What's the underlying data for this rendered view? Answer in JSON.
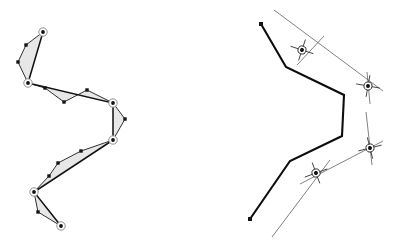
{
  "figure": {
    "background_color": "#ffffff",
    "width": 396,
    "height": 244,
    "panels": [
      {
        "id": "left-panel",
        "name": "original-vs-simplified-polyline",
        "description": "Original detailed polyline with small square vertices, simplified polyline through circled anchor points, and shaded displacement bands between them",
        "colors": {
          "band_fill": "#d9d9d9",
          "line": "#1a1a1a",
          "anchor_stroke": "#8f8f8f"
        },
        "anchor_points": [
          {
            "label": "A",
            "x": 43,
            "y": 32
          },
          {
            "label": "B",
            "x": 28,
            "y": 83
          },
          {
            "label": "C",
            "x": 113,
            "y": 103
          },
          {
            "label": "D",
            "x": 113,
            "y": 140
          },
          {
            "label": "E",
            "x": 34,
            "y": 192
          },
          {
            "label": "F",
            "x": 61,
            "y": 226
          }
        ],
        "original_vertices": [
          {
            "x": 43,
            "y": 32
          },
          {
            "x": 26,
            "y": 45
          },
          {
            "x": 18,
            "y": 62
          },
          {
            "x": 28,
            "y": 83
          },
          {
            "x": 45,
            "y": 88
          },
          {
            "x": 64,
            "y": 102
          },
          {
            "x": 87,
            "y": 90
          },
          {
            "x": 113,
            "y": 103
          },
          {
            "x": 125,
            "y": 119
          },
          {
            "x": 113,
            "y": 140
          },
          {
            "x": 81,
            "y": 151
          },
          {
            "x": 58,
            "y": 163
          },
          {
            "x": 49,
            "y": 176
          },
          {
            "x": 34,
            "y": 192
          },
          {
            "x": 38,
            "y": 212
          },
          {
            "x": 61,
            "y": 226
          }
        ],
        "simplified_segments": [
          {
            "from": "A",
            "to": "B"
          },
          {
            "from": "B",
            "to": "C"
          },
          {
            "from": "C",
            "to": "D"
          },
          {
            "from": "D",
            "to": "E"
          },
          {
            "from": "E",
            "to": "F"
          }
        ],
        "band_count": 5
      },
      {
        "id": "right-panel",
        "name": "simplified-polyline-with-construction-lines",
        "description": "Bold simplified polyline with thin construction rays and four cross-hair intersection markers",
        "colors": {
          "polyline": "#0d0d0d",
          "construction": "#4a4a4a",
          "marker_ring": "#2a2a2a"
        },
        "polyline_vertices": [
          {
            "x": 261,
            "y": 24
          },
          {
            "x": 286,
            "y": 67
          },
          {
            "x": 344,
            "y": 95
          },
          {
            "x": 342,
            "y": 136
          },
          {
            "x": 290,
            "y": 161
          },
          {
            "x": 250,
            "y": 219
          }
        ],
        "endpoint_dots": [
          {
            "x": 261,
            "y": 24
          },
          {
            "x": 250,
            "y": 219
          }
        ],
        "cross_markers": [
          {
            "label": "P1",
            "x": 302,
            "y": 50,
            "angle_deg": 18
          },
          {
            "label": "P2",
            "x": 368,
            "y": 86,
            "angle_deg": 10
          },
          {
            "label": "P3",
            "x": 370,
            "y": 148,
            "angle_deg": -14
          },
          {
            "label": "P4",
            "x": 316,
            "y": 173,
            "angle_deg": -20
          }
        ],
        "construction_rays": [
          {
            "name": "ray-upper-left",
            "x1": 274,
            "y1": 10,
            "x2": 383,
            "y2": 91
          },
          {
            "name": "ray-upper-right",
            "x1": 297,
            "y1": 65,
            "x2": 324,
            "y2": 36
          },
          {
            "name": "ray-vertical-right-upper",
            "x1": 367,
            "y1": 72,
            "x2": 370,
            "y2": 104
          },
          {
            "name": "ray-vertical-right-lower",
            "x1": 366,
            "y1": 112,
            "x2": 372,
            "y2": 165
          },
          {
            "name": "ray-lower-right",
            "x1": 383,
            "y1": 141,
            "x2": 300,
            "y2": 184
          },
          {
            "name": "ray-lower-left",
            "x1": 330,
            "y1": 160,
            "x2": 272,
            "y2": 237
          }
        ],
        "marker_count": 4
      }
    ],
    "legend_items": [],
    "labels": []
  }
}
